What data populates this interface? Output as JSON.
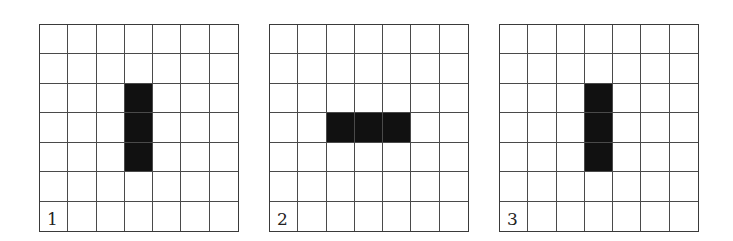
{
  "figure": {
    "grid_size": 7,
    "fill_color": "#111111",
    "line_color": "#4a4a4a",
    "panels": [
      {
        "label": "1",
        "left": 39,
        "filled": [
          [
            2,
            3
          ],
          [
            3,
            3
          ],
          [
            4,
            3
          ]
        ]
      },
      {
        "label": "2",
        "left": 269,
        "filled": [
          [
            3,
            2
          ],
          [
            3,
            3
          ],
          [
            3,
            4
          ]
        ]
      },
      {
        "label": "3",
        "left": 499,
        "filled": [
          [
            2,
            3
          ],
          [
            3,
            3
          ],
          [
            4,
            3
          ]
        ]
      }
    ]
  }
}
